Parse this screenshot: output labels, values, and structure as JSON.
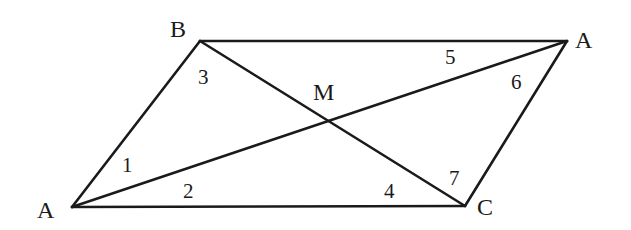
{
  "diagram": {
    "type": "geometry",
    "points": {
      "A_left": {
        "label": "A",
        "x": 72,
        "y": 207
      },
      "B": {
        "label": "B",
        "x": 200,
        "y": 41
      },
      "A_right": {
        "label": "A",
        "x": 567,
        "y": 41
      },
      "C": {
        "label": "C",
        "x": 465,
        "y": 206
      },
      "M": {
        "label": "M",
        "x": 322,
        "y": 122
      }
    },
    "segments": [
      {
        "name": "side-A-B",
        "from": "A_left",
        "to": "B"
      },
      {
        "name": "side-B-A",
        "from": "B",
        "to": "A_right"
      },
      {
        "name": "side-A-C",
        "from": "A_right",
        "to": "C"
      },
      {
        "name": "side-C-A",
        "from": "C",
        "to": "A_left"
      },
      {
        "name": "diagonal-A-A",
        "from": "A_left",
        "to": "A_right"
      },
      {
        "name": "diagonal-B-C",
        "from": "B",
        "to": "C"
      }
    ],
    "vertex_labels": [
      {
        "text": "B",
        "x": 170,
        "y": 37
      },
      {
        "text": "A",
        "x": 37,
        "y": 218
      },
      {
        "text": "A",
        "x": 575,
        "y": 48
      },
      {
        "text": "C",
        "x": 477,
        "y": 215
      },
      {
        "text": "M",
        "x": 313,
        "y": 100
      }
    ],
    "angle_labels": [
      {
        "text": "1",
        "x": 122,
        "y": 172
      },
      {
        "text": "2",
        "x": 183,
        "y": 198
      },
      {
        "text": "3",
        "x": 198,
        "y": 84
      },
      {
        "text": "4",
        "x": 384,
        "y": 198
      },
      {
        "text": "5",
        "x": 445,
        "y": 64
      },
      {
        "text": "6",
        "x": 511,
        "y": 89
      },
      {
        "text": "7",
        "x": 449,
        "y": 185
      }
    ]
  }
}
